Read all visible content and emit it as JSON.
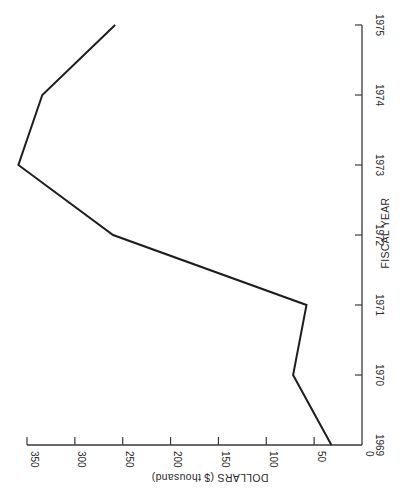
{
  "chart_data": {
    "type": "line",
    "orientation": "rotated-90-clockwise",
    "title": "",
    "xlabel": "FISCAL YEAR",
    "ylabel": "DOLLARS ($ thousand)",
    "categories": [
      "1969",
      "1970",
      "1971",
      "1972",
      "1973",
      "1974",
      "1975"
    ],
    "x_ticks": [
      "1969",
      "1970",
      "1971",
      "1972",
      "1973",
      "1974",
      "1975"
    ],
    "y_ticks": [
      0,
      50,
      100,
      150,
      200,
      250,
      300,
      350
    ],
    "ylim": [
      0,
      350
    ],
    "grid": false,
    "legend": null,
    "series": [
      {
        "name": "Dollars",
        "values": [
          32,
          72,
          58,
          260,
          359,
          334,
          258
        ]
      }
    ]
  },
  "colors": {
    "line": "#1e1e1e",
    "axis": "#3a3a3a",
    "background": "#ffffff"
  }
}
